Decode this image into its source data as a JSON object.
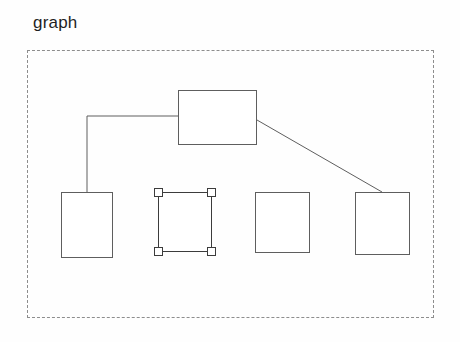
{
  "canvas": {
    "width": 460,
    "height": 342,
    "background": "#fefefe"
  },
  "group": {
    "title": "graph",
    "title_x": 33,
    "title_y": 13,
    "frame": {
      "x": 27,
      "y": 50,
      "width": 407,
      "height": 268
    },
    "border_style": "dashed",
    "border_color": "#8d8d8d"
  },
  "colors": {
    "stroke": "#5e5e5e",
    "selection_stroke": "#3c3c3c",
    "node_fill": "#ffffff",
    "text": "#1f1f1f"
  },
  "nodes": [
    {
      "name": "node-parent",
      "label": "",
      "x": 178,
      "y": 90,
      "width": 79,
      "height": 55,
      "selected": false
    },
    {
      "name": "node-child-1",
      "label": "",
      "x": 61,
      "y": 192,
      "width": 52,
      "height": 66,
      "selected": false
    },
    {
      "name": "node-child-2",
      "label": "",
      "x": 158,
      "y": 192,
      "width": 54,
      "height": 60,
      "selected": true
    },
    {
      "name": "node-child-3",
      "label": "",
      "x": 255,
      "y": 192,
      "width": 55,
      "height": 61,
      "selected": false
    },
    {
      "name": "node-child-4",
      "label": "",
      "x": 355,
      "y": 192,
      "width": 55,
      "height": 63,
      "selected": false
    }
  ],
  "edges": [
    {
      "name": "edge-parent-to-child-1",
      "kind": "orthogonal",
      "path": "M 178 116 L 87 116 L 87 192"
    },
    {
      "name": "edge-parent-to-child-4",
      "kind": "straight",
      "path": "M 257 120 L 382 192"
    }
  ],
  "handles": [
    {
      "name": "resize-handle-nw",
      "position": "nw"
    },
    {
      "name": "resize-handle-ne",
      "position": "ne"
    },
    {
      "name": "resize-handle-sw",
      "position": "sw"
    },
    {
      "name": "resize-handle-se",
      "position": "se"
    }
  ]
}
